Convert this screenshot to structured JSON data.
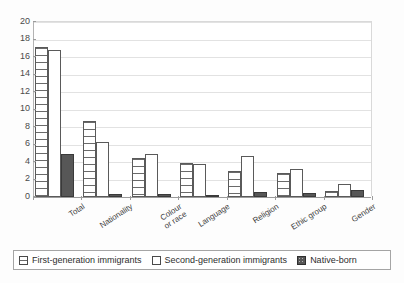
{
  "chart_data": {
    "type": "bar",
    "title": "",
    "subtitle": "",
    "xlabel": "",
    "ylabel": "",
    "ylim": [
      0,
      20
    ],
    "ytick_step": 2,
    "yticks": [
      "0",
      "2",
      "4",
      "6",
      "8",
      "10",
      "12",
      "14",
      "16",
      "18",
      "20"
    ],
    "grid": true,
    "legend_position": "bottom",
    "categories": [
      "Total",
      "Nationality",
      "Colour\nor race",
      "Language",
      "Religion",
      "Ethic group",
      "Gender"
    ],
    "series": [
      {
        "name": "First-generation immigrants",
        "pattern": "horizontal-lines",
        "color": "#ffffff",
        "values": [
          17.1,
          8.7,
          4.5,
          3.9,
          3.0,
          2.7,
          0.7
        ]
      },
      {
        "name": "Second-generation immigrants",
        "pattern": "dotted",
        "color": "#ffffff",
        "values": [
          16.8,
          6.3,
          4.9,
          3.75,
          4.7,
          3.2,
          1.5
        ]
      },
      {
        "name": "Native-born",
        "pattern": "solid",
        "color": "#575757",
        "values": [
          4.9,
          0.3,
          0.4,
          0.25,
          0.6,
          0.45,
          0.85
        ]
      }
    ]
  },
  "legend": {
    "items": [
      {
        "label": "First-generation immigrants"
      },
      {
        "label": "Second-generation immigrants"
      },
      {
        "label": "Native-born"
      }
    ]
  }
}
